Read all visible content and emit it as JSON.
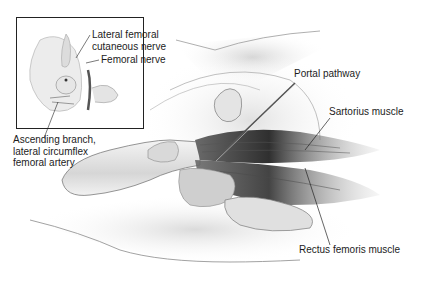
{
  "figure": {
    "type": "anatomical-illustration"
  },
  "inset": {
    "labels": {
      "lateral_femoral": [
        "Lateral femoral",
        "cutaneous nerve"
      ],
      "femoral_nerve": "Femoral nerve",
      "ascending_branch": [
        "Ascending branch,",
        "lateral circumflex",
        "femoral artery"
      ]
    }
  },
  "main": {
    "labels": {
      "portal_pathway": "Portal pathway",
      "sartorius": "Sartorius muscle",
      "rectus_femoris": "Rectus femoris muscle"
    }
  },
  "colors": {
    "background": "#ffffff",
    "skin_light": "#e8e8e8",
    "skin_mid": "#c8c8c8",
    "muscle_dark": "#3a3a3a",
    "outline": "#555555",
    "text": "#1c1c1c"
  }
}
